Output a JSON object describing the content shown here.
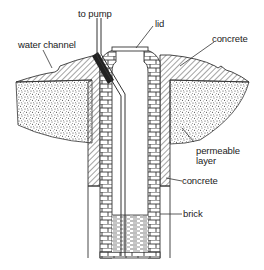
{
  "diagram": {
    "labels": {
      "to_pump": "to pump",
      "lid": "lid",
      "concrete_top": "concrete",
      "water_channel": "water channel",
      "permeable_layer_1": "permeable",
      "permeable_layer_2": "layer",
      "concrete_side": "concrete",
      "brick": "brick"
    },
    "colors": {
      "ink": "#222222",
      "background": "#ffffff"
    }
  }
}
